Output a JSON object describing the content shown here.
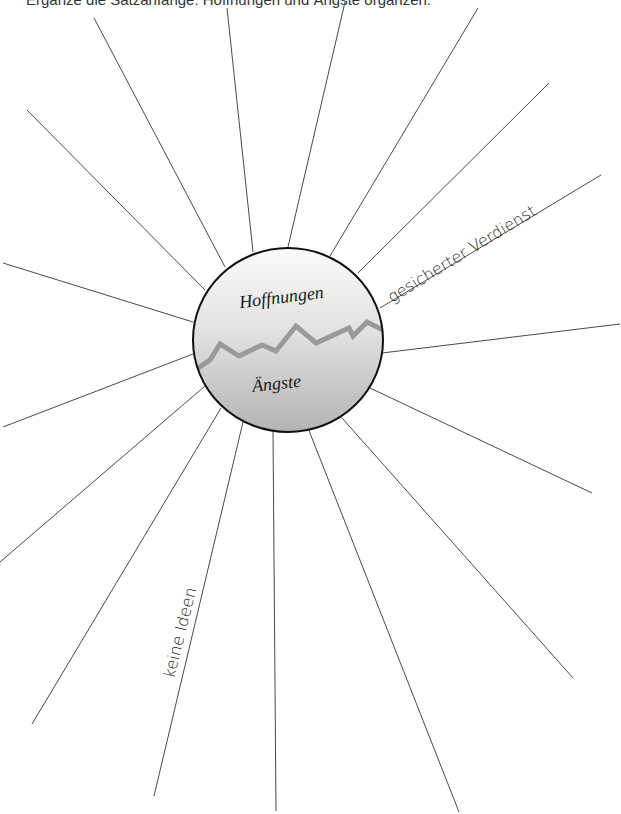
{
  "header": {
    "instruction": "Ergänze die Satzanfänge: Hoffnungen und Ängste organzen:"
  },
  "diagram": {
    "center": {
      "x": 288,
      "y": 340,
      "rx": 95,
      "ry": 92
    },
    "top_label": "Hoffnungen",
    "bottom_label": "Ängste",
    "divider_color": "#999999",
    "fill_top": "#f4f4f4",
    "fill_bottom": "#bdbdbd",
    "ray_count": 18,
    "filled_rays": [
      {
        "text": "gesicherter Verdienst",
        "position": "upper-right"
      },
      {
        "text": "keine Ideen",
        "position": "lower-left"
      }
    ]
  }
}
